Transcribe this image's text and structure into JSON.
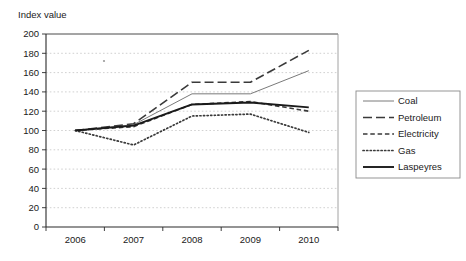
{
  "chart_data": {
    "type": "line",
    "title": "",
    "ylabel": "Index value",
    "xlabel": "",
    "x": [
      2006,
      2007,
      2008,
      2009,
      2010
    ],
    "xtick_labels": [
      "2006",
      "2007",
      "2008",
      "2009",
      "2010"
    ],
    "ylim": [
      0,
      200
    ],
    "ytick_labels": [
      "0",
      "20",
      "40",
      "60",
      "80",
      "100",
      "120",
      "140",
      "160",
      "180",
      "200"
    ],
    "yticks": [
      0,
      20,
      40,
      60,
      80,
      100,
      120,
      140,
      160,
      180,
      200
    ],
    "grid": true,
    "legend_position": "right",
    "series": [
      {
        "name": "Coal",
        "values": [
          100,
          106,
          138,
          138,
          162
        ],
        "style": "solid-thin",
        "color": "#7a7a7a"
      },
      {
        "name": "Petroleum",
        "values": [
          100,
          107,
          150,
          150,
          183
        ],
        "style": "long-dash",
        "color": "#3a3a3a"
      },
      {
        "name": "Electricity",
        "values": [
          100,
          104,
          127,
          130,
          120
        ],
        "style": "short-dash",
        "color": "#3a3a3a"
      },
      {
        "name": "Gas",
        "values": [
          100,
          85,
          115,
          117,
          98
        ],
        "style": "dotted",
        "color": "#3a3a3a"
      },
      {
        "name": "Laspeyres",
        "values": [
          100,
          105,
          127,
          129,
          124
        ],
        "style": "solid-thick",
        "color": "#1a1a1a"
      }
    ]
  },
  "legend": {
    "entries": [
      "Coal",
      "Petroleum",
      "Electricity",
      "Gas",
      "Laspeyres"
    ]
  }
}
